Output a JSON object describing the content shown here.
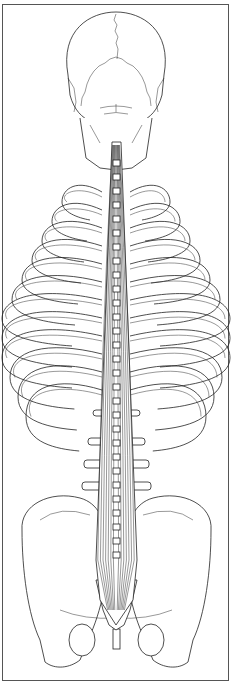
{
  "figure": {
    "caption": "",
    "colors": {
      "line": "#222222",
      "background": "#ffffff",
      "border": "#555555"
    },
    "parts": [
      "skull",
      "cervical-spine",
      "rib-cage",
      "erector-spinae-muscles",
      "lumbar-vertebrae",
      "pelvis",
      "sacrum"
    ]
  }
}
